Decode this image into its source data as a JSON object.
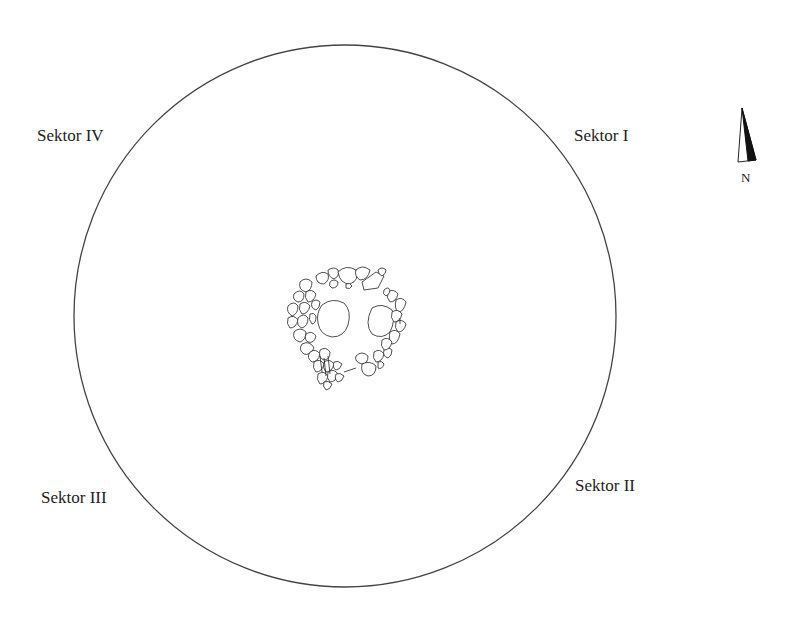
{
  "diagram": {
    "type": "archaeological-excavation-plan",
    "sectors": [
      {
        "id": "I",
        "label": "Sektor I",
        "position": "upper-right"
      },
      {
        "id": "II",
        "label": "Sektor II",
        "position": "lower-right"
      },
      {
        "id": "III",
        "label": "Sektor III",
        "position": "lower-left"
      },
      {
        "id": "IV",
        "label": "Sektor IV",
        "position": "upper-left"
      }
    ],
    "north_arrow": {
      "label": "N"
    },
    "circle": {
      "cx": 345,
      "cy": 316,
      "r": 271,
      "stroke": "#444444"
    },
    "feature": {
      "description": "stone ring cluster",
      "cx": 345,
      "cy": 325
    }
  }
}
